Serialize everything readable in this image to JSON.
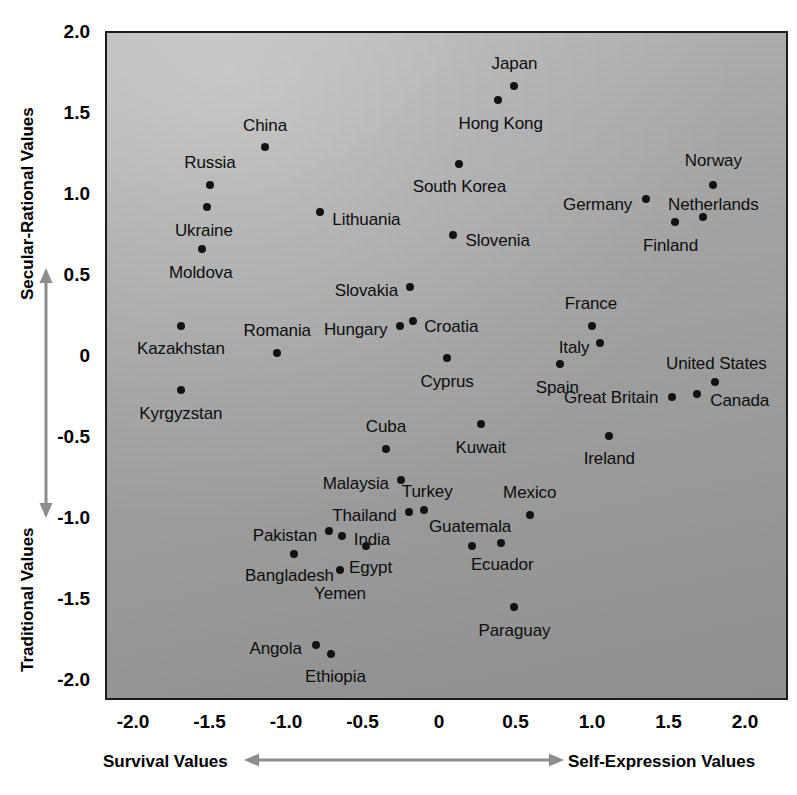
{
  "axes": {
    "y_title_top": "Secular-Rational Values",
    "y_title_bottom": "Traditional Values",
    "x_title_left": "Survival Values",
    "x_title_right": "Self-Expression Values",
    "y_ticks": [
      "2.0",
      "1.5",
      "1.0",
      "0.5",
      "0",
      "-0.5",
      "-1.0",
      "-1.5",
      "-2.0"
    ],
    "x_ticks": [
      "-2.0",
      "-1.5",
      "-1.0",
      "-0.5",
      "0",
      "0.5",
      "1.0",
      "1.5",
      "2.0"
    ]
  },
  "colors": {
    "plot_background_light": "#b7b7b7",
    "plot_background_dark": "#909090",
    "border": "#1c1c1c",
    "point": "#121212",
    "label_text": "#0d0d0d",
    "axis_text": "#000000",
    "arrow": "#8c8c8c"
  },
  "chart_data": {
    "type": "scatter",
    "title": "",
    "xlabel": "Survival Values ↔ Self-Expression Values",
    "ylabel": "Traditional Values ↔ Secular-Rational Values",
    "xlim": [
      -2.25,
      2.3
    ],
    "ylim": [
      -2.25,
      2.05
    ],
    "grid": false,
    "legend": "none",
    "points": [
      {
        "label": "Japan",
        "x": 0.48,
        "y": 1.68,
        "lx": 0.48,
        "ly": 1.82,
        "align": "c"
      },
      {
        "label": "Hong Kong",
        "x": 0.37,
        "y": 1.59,
        "lx": 0.39,
        "ly": 1.45,
        "align": "c"
      },
      {
        "label": "China",
        "x": -1.15,
        "y": 1.3,
        "lx": -1.15,
        "ly": 1.44,
        "align": "c"
      },
      {
        "label": "South Korea",
        "x": 0.12,
        "y": 1.2,
        "lx": 0.12,
        "ly": 1.06,
        "align": "c"
      },
      {
        "label": "Norway",
        "x": 1.78,
        "y": 1.07,
        "lx": 1.78,
        "ly": 1.22,
        "align": "c"
      },
      {
        "label": "Russia",
        "x": -1.51,
        "y": 1.07,
        "lx": -1.51,
        "ly": 1.21,
        "align": "c"
      },
      {
        "label": "Germany",
        "x": 1.34,
        "y": 0.98,
        "lx": 1.25,
        "ly": 0.95,
        "align": "l"
      },
      {
        "label": "Ukraine",
        "x": -1.53,
        "y": 0.93,
        "lx": -1.55,
        "ly": 0.79,
        "align": "c"
      },
      {
        "label": "Lithuania",
        "x": -0.79,
        "y": 0.9,
        "lx": -0.71,
        "ly": 0.86,
        "align": "r"
      },
      {
        "label": "Netherlands",
        "x": 1.71,
        "y": 0.87,
        "lx": 1.78,
        "ly": 0.95,
        "align": "c"
      },
      {
        "label": "Finland",
        "x": 1.53,
        "y": 0.84,
        "lx": 1.5,
        "ly": 0.7,
        "align": "c"
      },
      {
        "label": "Slovenia",
        "x": 0.08,
        "y": 0.76,
        "lx": 0.16,
        "ly": 0.73,
        "align": "r"
      },
      {
        "label": "Moldova",
        "x": -1.56,
        "y": 0.67,
        "lx": -1.57,
        "ly": 0.53,
        "align": "c"
      },
      {
        "label": "Slovakia",
        "x": -0.2,
        "y": 0.44,
        "lx": -0.28,
        "ly": 0.42,
        "align": "l"
      },
      {
        "label": "France",
        "x": 0.99,
        "y": 0.2,
        "lx": 0.98,
        "ly": 0.34,
        "align": "c"
      },
      {
        "label": "Kazakhstan",
        "x": -1.7,
        "y": 0.2,
        "lx": -1.7,
        "ly": 0.06,
        "align": "c"
      },
      {
        "label": "Croatia",
        "x": -0.18,
        "y": 0.23,
        "lx": -0.11,
        "ly": 0.2,
        "align": "r"
      },
      {
        "label": "Hungary",
        "x": -0.27,
        "y": 0.2,
        "lx": -0.35,
        "ly": 0.18,
        "align": "l"
      },
      {
        "label": "Italy",
        "x": 1.04,
        "y": 0.09,
        "lx": 0.97,
        "ly": 0.07,
        "align": "l"
      },
      {
        "label": "Romania",
        "x": -1.07,
        "y": 0.03,
        "lx": -1.07,
        "ly": 0.17,
        "align": "c"
      },
      {
        "label": "Cyprus",
        "x": 0.04,
        "y": -0.0,
        "lx": 0.04,
        "ly": -0.14,
        "align": "c"
      },
      {
        "label": "Spain",
        "x": 0.78,
        "y": -0.04,
        "lx": 0.76,
        "ly": -0.18,
        "align": "c"
      },
      {
        "label": "United States",
        "x": 1.79,
        "y": -0.15,
        "lx": 1.8,
        "ly": -0.03,
        "align": "c"
      },
      {
        "label": "Canada",
        "x": 1.67,
        "y": -0.22,
        "lx": 1.76,
        "ly": -0.26,
        "align": "r"
      },
      {
        "label": "Kyrgyzstan",
        "x": -1.7,
        "y": -0.2,
        "lx": -1.7,
        "ly": -0.34,
        "align": "c"
      },
      {
        "label": "Great Britain",
        "x": 1.51,
        "y": -0.24,
        "lx": 1.42,
        "ly": -0.24,
        "align": "l"
      },
      {
        "label": "Kuwait",
        "x": 0.26,
        "y": -0.41,
        "lx": 0.26,
        "ly": -0.55,
        "align": "c"
      },
      {
        "label": "Ireland",
        "x": 1.1,
        "y": -0.48,
        "lx": 1.1,
        "ly": -0.62,
        "align": "c"
      },
      {
        "label": "Cuba",
        "x": -0.36,
        "y": -0.56,
        "lx": -0.36,
        "ly": -0.42,
        "align": "c"
      },
      {
        "label": "Malaysia",
        "x": -0.26,
        "y": -0.75,
        "lx": -0.34,
        "ly": -0.77,
        "align": "l"
      },
      {
        "label": "Turkey",
        "x": -0.11,
        "y": -0.94,
        "lx": -0.09,
        "ly": -0.82,
        "align": "c"
      },
      {
        "label": "Thailand",
        "x": -0.21,
        "y": -0.95,
        "lx": -0.29,
        "ly": -0.97,
        "align": "l"
      },
      {
        "label": "Mexico",
        "x": 0.58,
        "y": -0.97,
        "lx": 0.58,
        "ly": -0.83,
        "align": "c"
      },
      {
        "label": "Pakistan",
        "x": -0.73,
        "y": -1.07,
        "lx": -0.81,
        "ly": -1.09,
        "align": "l"
      },
      {
        "label": "India",
        "x": -0.65,
        "y": -1.1,
        "lx": -0.57,
        "ly": -1.12,
        "align": "r"
      },
      {
        "label": "Guatemala",
        "x": 0.2,
        "y": -1.16,
        "lx": 0.19,
        "ly": -1.04,
        "align": "c"
      },
      {
        "label": "Egypt",
        "x": -0.49,
        "y": -1.16,
        "lx": -0.46,
        "ly": -1.29,
        "align": "c"
      },
      {
        "label": "Ecuador",
        "x": 0.39,
        "y": -1.14,
        "lx": 0.4,
        "ly": -1.27,
        "align": "c"
      },
      {
        "label": "Bangladesh",
        "x": -0.96,
        "y": -1.21,
        "lx": -0.99,
        "ly": -1.34,
        "align": "c"
      },
      {
        "label": "Yemen",
        "x": -0.66,
        "y": -1.31,
        "lx": -0.66,
        "ly": -1.45,
        "align": "c"
      },
      {
        "label": "Paraguay",
        "x": 0.48,
        "y": -1.54,
        "lx": 0.48,
        "ly": -1.68,
        "align": "c"
      },
      {
        "label": "Angola",
        "x": -0.82,
        "y": -1.77,
        "lx": -0.91,
        "ly": -1.79,
        "align": "l"
      },
      {
        "label": "Ethiopia",
        "x": -0.72,
        "y": -1.83,
        "lx": -0.69,
        "ly": -1.96,
        "align": "c"
      }
    ]
  }
}
